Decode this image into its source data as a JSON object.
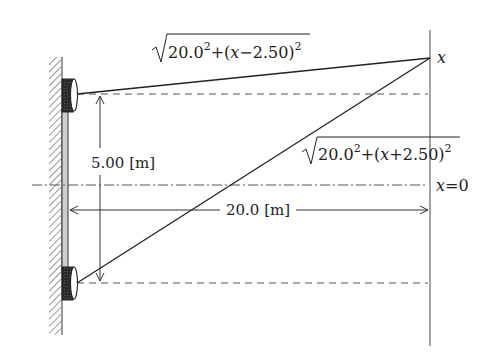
{
  "diagram": {
    "type": "geometry-schematic",
    "labels": {
      "upper_path_formula": {
        "prefix": "20.0",
        "exp": "2",
        "middle": "+(",
        "var": "x",
        "op": "−",
        "value": "2.50",
        "close": ")",
        "exp2": "2"
      },
      "lower_path_formula": {
        "prefix": "20.0",
        "exp": "2",
        "middle": "+(",
        "var": "x",
        "op": "+",
        "value": "2.50",
        "close": ")",
        "exp2": "2"
      },
      "point_label": "x",
      "origin_label_var": "x",
      "origin_label_rest": "=0",
      "vertical_distance": "5.00 [m]",
      "horizontal_distance": "20.0 [m]"
    },
    "elements": {
      "wall": "hatched wall on left",
      "speakers": [
        "upper-speaker",
        "lower-speaker"
      ],
      "screen_line": "vertical line at right",
      "center_line": "dash-dot line x=0",
      "guide_lines": [
        "dashed line through upper speaker",
        "dashed line through lower speaker"
      ]
    },
    "colors": {
      "line": "#2a2a2a",
      "dashed": "#555555",
      "speaker": "#2b2b2b",
      "hatch": "#444444"
    }
  }
}
